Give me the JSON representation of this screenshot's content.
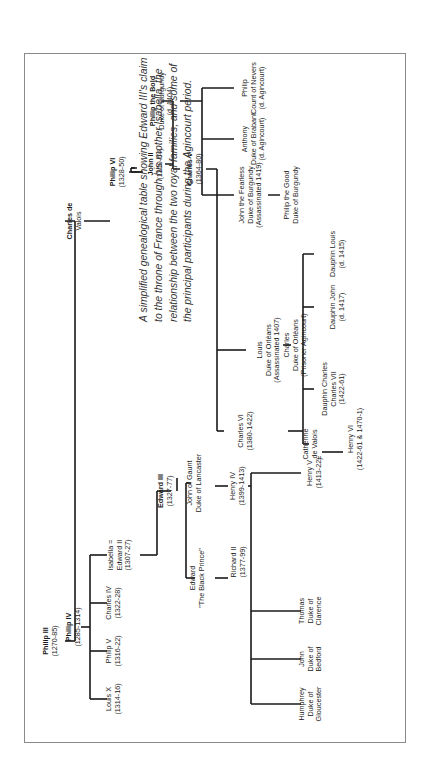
{
  "caption": "A simplified genealogical table showing Edward III's claim to the throne of France through his mother Isabella, the relationship between the two royal families, and some of the principal participants during the Agincourt period.",
  "colors": {
    "line": "#1a1a1a",
    "text": "#1a1a1a",
    "border": "#8a8a8a",
    "caption": "#333333"
  },
  "people": {
    "philip_iii": {
      "name": "Philip III",
      "sub": "",
      "dates": "(1270-85)"
    },
    "philip_iv": {
      "name": "Philip IV",
      "sub": "",
      "dates": "(1285-1314)"
    },
    "charles_de_valois": {
      "name": "Charles de",
      "sub": "Valois",
      "dates": ""
    },
    "philip_vi": {
      "name": "Philip VI",
      "sub": "",
      "dates": "(1328-50)"
    },
    "john_ii": {
      "name": "John II",
      "sub": "",
      "dates": "(1350-64)"
    },
    "philip_the_bold": {
      "name": "Philip the Bold",
      "sub": "Duke of Burgundy",
      "dates": "(d. 1404)"
    },
    "charles_v": {
      "name": "Charles V",
      "sub": "",
      "dates": "(1364-80)"
    },
    "louis_x": {
      "name": "Louis X",
      "sub": "",
      "dates": "(1314-16)"
    },
    "philip_v": {
      "name": "Philip V",
      "sub": "",
      "dates": "(1316-22)"
    },
    "charles_iv": {
      "name": "Charles IV",
      "sub": "",
      "dates": "(1322-28)"
    },
    "isabella": {
      "name": "Isabella =",
      "sub": "Edward II",
      "dates": "(1307-27)"
    },
    "edward_iii": {
      "name": "Edward III",
      "sub": "",
      "dates": "(1327-77)"
    },
    "black_prince": {
      "name": "Edward",
      "sub": "\"The Black Prince\"",
      "dates": ""
    },
    "john_of_gaunt": {
      "name": "John of Gaunt",
      "sub": "Duke of Lancaster",
      "dates": ""
    },
    "richard_ii": {
      "name": "Richard II",
      "sub": "",
      "dates": "(1377-99)"
    },
    "henry_iv": {
      "name": "Henry IV",
      "sub": "",
      "dates": "(1399-1413)"
    },
    "humphrey": {
      "name": "Humphrey",
      "sub": "Duke of",
      "dates": "Gloucester"
    },
    "john_bedford": {
      "name": "John",
      "sub": "Duke of",
      "dates": "Bedford"
    },
    "thomas_clarence": {
      "name": "Thomas",
      "sub": "Duke of",
      "dates": "Clarence"
    },
    "henry_v": {
      "name": "Henry V",
      "sub": "",
      "dates": "(1413-22)"
    },
    "marriage_sign": "=",
    "catherine": {
      "name": "Catherine",
      "sub": "de Valois",
      "dates": ""
    },
    "henry_vi": {
      "name": "Henry VI",
      "sub": "",
      "dates": "(1422-61 & 1470-1)"
    },
    "charles_vi": {
      "name": "Charles VI",
      "sub": "",
      "dates": "(1380-1422)"
    },
    "louis_orleans": {
      "name": "Louis",
      "sub": "Duke of Orléans",
      "dates": "(Assassinated 1407)"
    },
    "charles_orleans": {
      "name": "Charles",
      "sub": "Duke of Orléans",
      "dates": "(Prisoner Agincourt)"
    },
    "dauphin_charles": {
      "name": "Dauphin Charles",
      "sub": "Charles VII",
      "dates": "(1422-61)"
    },
    "dauphin_john": {
      "name": "Dauphin John",
      "sub": "",
      "dates": "(d. 1417)"
    },
    "dauphin_louis": {
      "name": "Dauphin Louis",
      "sub": "",
      "dates": "(d. 1415)"
    },
    "john_the_fearless": {
      "name": "John the Fearless",
      "sub": "Duke of Burgundy",
      "dates": "(Assassinated 1419)"
    },
    "philip_the_good": {
      "name": "Philip the Good",
      "sub": "Duke of Burgundy",
      "dates": ""
    },
    "anthony": {
      "name": "Anthony",
      "sub": "Duke of Brabant",
      "dates": "(d. Agincourt)"
    },
    "philip_nevers": {
      "name": "Philip",
      "sub": "Count of Nevers",
      "dates": "(d. Agincourt)"
    }
  }
}
